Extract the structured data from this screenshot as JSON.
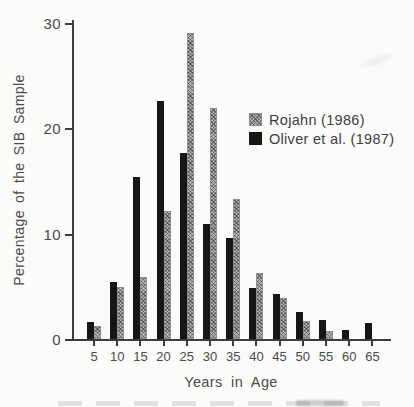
{
  "chart_data": {
    "type": "bar",
    "title": "",
    "xlabel": "Years in Age",
    "ylabel": "Percentage of the SIB Sample",
    "categories": [
      5,
      10,
      15,
      20,
      25,
      30,
      35,
      40,
      45,
      50,
      55,
      60,
      65
    ],
    "x_tick_labels": [
      "5",
      "10",
      "15",
      "20",
      "25",
      "30",
      "35",
      "40",
      "45",
      "50",
      "55",
      "60",
      "65"
    ],
    "y_ticks": [
      0,
      10,
      20,
      30
    ],
    "y_tick_labels": [
      "0",
      "10",
      "20",
      "30"
    ],
    "ylim": [
      0,
      30
    ],
    "grid": false,
    "legend_position": "inside-upper-right",
    "series": [
      {
        "name": "Oliver et al. (1987)",
        "swatch": "solid-black",
        "color": "#161616",
        "bar_position": "left-of-tick",
        "values": [
          1.6,
          5.4,
          15.4,
          22.6,
          17.6,
          10.9,
          9.6,
          4.8,
          4.3,
          2.6,
          1.8,
          0.9,
          1.5
        ]
      },
      {
        "name": "Rojahn (1986)",
        "swatch": "gray-crosshatch",
        "color": "#b5b5b5",
        "bar_position": "right-of-tick",
        "values": [
          1.2,
          4.9,
          5.9,
          12.1,
          29.0,
          21.9,
          13.3,
          6.3,
          3.9,
          1.7,
          0.8,
          0,
          0
        ]
      }
    ]
  },
  "legend": {
    "items": [
      {
        "label": "Rojahn (1986)",
        "swatch": "gray-crosshatch"
      },
      {
        "label": "Oliver et al. (1987)",
        "swatch": "solid-black"
      }
    ]
  }
}
